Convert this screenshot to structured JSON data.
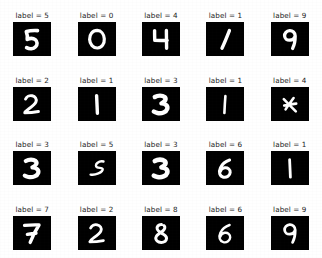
{
  "figure": {
    "type": "image-grid",
    "rows": 4,
    "columns": 5,
    "background_color": "#ffffff",
    "image_background_color": "#000000",
    "digit_stroke_color": "#ffffff",
    "label_color": "#1a1a1a",
    "label_prefix": "label = "
  },
  "chart_data": {
    "type": "table",
    "title": "",
    "rows": 4,
    "columns": 5,
    "labels": [
      5,
      0,
      4,
      1,
      9,
      2,
      1,
      3,
      1,
      4,
      3,
      5,
      3,
      6,
      1,
      7,
      2,
      8,
      6,
      9
    ]
  },
  "cells": [
    {
      "caption": "label = 5",
      "digit": 5,
      "row": 1,
      "col": 1
    },
    {
      "caption": "label = 0",
      "digit": 0,
      "row": 1,
      "col": 2
    },
    {
      "caption": "label = 4",
      "digit": 4,
      "row": 1,
      "col": 3
    },
    {
      "caption": "label = 1",
      "digit": 1,
      "row": 1,
      "col": 4
    },
    {
      "caption": "label = 9",
      "digit": 9,
      "row": 1,
      "col": 5
    },
    {
      "caption": "label = 2",
      "digit": 2,
      "row": 2,
      "col": 1
    },
    {
      "caption": "label = 1",
      "digit": 1,
      "row": 2,
      "col": 2
    },
    {
      "caption": "label = 3",
      "digit": 3,
      "row": 2,
      "col": 3
    },
    {
      "caption": "label = 1",
      "digit": 1,
      "row": 2,
      "col": 4
    },
    {
      "caption": "label = 4",
      "digit": 4,
      "row": 2,
      "col": 5
    },
    {
      "caption": "label = 3",
      "digit": 3,
      "row": 3,
      "col": 1
    },
    {
      "caption": "label = 5",
      "digit": 5,
      "row": 3,
      "col": 2
    },
    {
      "caption": "label = 3",
      "digit": 3,
      "row": 3,
      "col": 3
    },
    {
      "caption": "label = 6",
      "digit": 6,
      "row": 3,
      "col": 4
    },
    {
      "caption": "label = 1",
      "digit": 1,
      "row": 3,
      "col": 5
    },
    {
      "caption": "label = 7",
      "digit": 7,
      "row": 4,
      "col": 1
    },
    {
      "caption": "label = 2",
      "digit": 2,
      "row": 4,
      "col": 2
    },
    {
      "caption": "label = 8",
      "digit": 8,
      "row": 4,
      "col": 3
    },
    {
      "caption": "label = 6",
      "digit": 6,
      "row": 4,
      "col": 4
    },
    {
      "caption": "label = 9",
      "digit": 9,
      "row": 4,
      "col": 5
    }
  ]
}
